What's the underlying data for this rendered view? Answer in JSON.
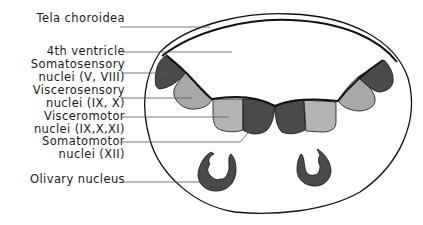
{
  "labels": [
    {
      "id": "tela",
      "lines": [
        "Tela choroidea"
      ]
    },
    {
      "id": "ventricle",
      "lines": [
        "4th ventricle"
      ]
    },
    {
      "id": "somatosensory",
      "lines": [
        "Somatosensory",
        "nuclei (V, VIII)"
      ]
    },
    {
      "id": "viscerosensory",
      "lines": [
        "Viscerosensory",
        "nuclei  (IX, X)"
      ]
    },
    {
      "id": "visceromotor",
      "lines": [
        "Visceromotor",
        "nuclei (IX,X,XI)"
      ]
    },
    {
      "id": "somatomotor",
      "lines": [
        "Somatomotor",
        "nuclei  (XII)"
      ]
    },
    {
      "id": "olivary",
      "lines": [
        "Olivary  nucleus"
      ]
    }
  ],
  "colors": {
    "dark_nucleus": "#4a4a4a",
    "light_nucleus": "#a8a8a8",
    "outline": "#111111",
    "leader_line": "#555555"
  }
}
